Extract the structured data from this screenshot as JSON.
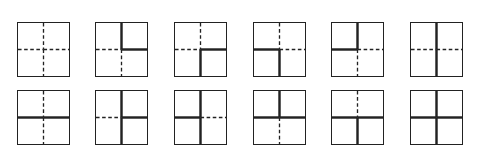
{
  "figure": {
    "colors": {
      "line": "#222222",
      "background": "#ffffff"
    },
    "rows": [
      {
        "squares": [
          {
            "top": "dashed",
            "bottom": "dashed",
            "left": "dashed",
            "right": "dashed"
          },
          {
            "top": "solid",
            "bottom": "dashed",
            "left": "dashed",
            "right": "solid"
          },
          {
            "top": "dashed",
            "bottom": "solid",
            "left": "dashed",
            "right": "solid"
          },
          {
            "top": "dashed",
            "bottom": "solid",
            "left": "solid",
            "right": "dashed"
          },
          {
            "top": "solid",
            "bottom": "dashed",
            "left": "solid",
            "right": "dashed"
          },
          {
            "top": "solid",
            "bottom": "solid",
            "left": "dashed",
            "right": "dashed"
          }
        ]
      },
      {
        "squares": [
          {
            "top": "dashed",
            "bottom": "dashed",
            "left": "solid",
            "right": "solid"
          },
          {
            "top": "solid",
            "bottom": "solid",
            "left": "dashed",
            "right": "solid"
          },
          {
            "top": "solid",
            "bottom": "solid",
            "left": "solid",
            "right": "dashed"
          },
          {
            "top": "solid",
            "bottom": "dashed",
            "left": "solid",
            "right": "solid"
          },
          {
            "top": "dashed",
            "bottom": "solid",
            "left": "solid",
            "right": "solid"
          },
          {
            "top": "solid",
            "bottom": "solid",
            "left": "solid",
            "right": "solid"
          }
        ]
      }
    ]
  }
}
